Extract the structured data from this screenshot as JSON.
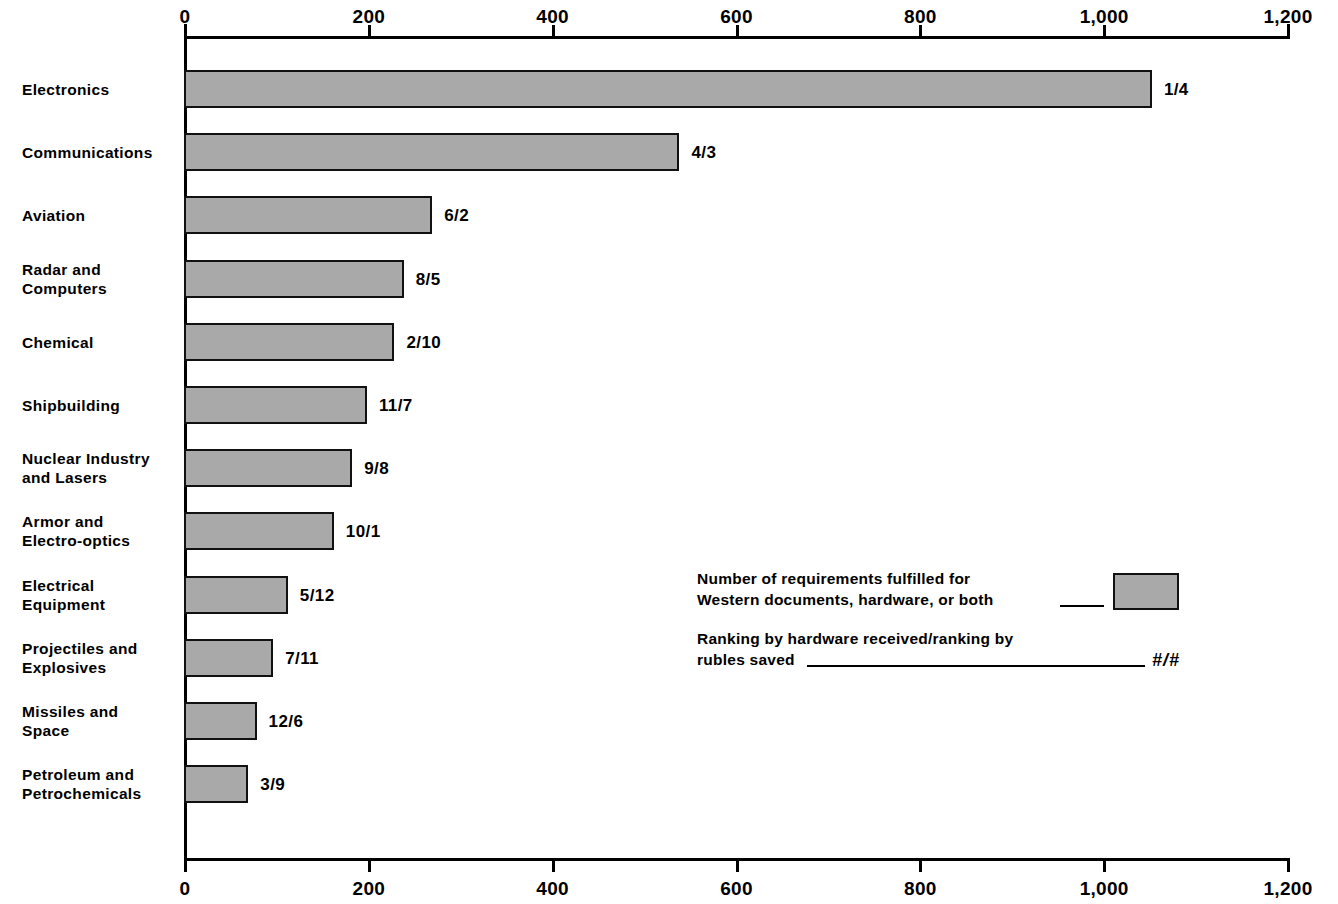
{
  "chart_data": {
    "type": "bar",
    "orientation": "horizontal",
    "title": "",
    "subtitle": "",
    "xlabel": "",
    "ylabel": "",
    "xlim": [
      0,
      1200
    ],
    "grid": false,
    "legend_position": "inside-right",
    "axis_ticks_top": [
      "0",
      "200",
      "400",
      "600",
      "800",
      "1,000",
      "1,200"
    ],
    "axis_ticks_bottom": [
      "0",
      "200",
      "400",
      "600",
      "800",
      "1,000",
      "1,200"
    ],
    "tick_values": [
      0,
      200,
      400,
      600,
      800,
      1000,
      1200
    ],
    "categories": [
      "Electronics",
      "Communications",
      "Aviation",
      "Radar and\nComputers",
      "Chemical",
      "Shipbuilding",
      "Nuclear Industry\nand Lasers",
      "Armor and\nElectro-optics",
      "Electrical\nEquipment",
      "Projectiles and\nExplosives",
      "Missiles and\nSpace",
      "Petroleum and\nPetrochemicals"
    ],
    "values": [
      1053,
      539,
      270,
      239,
      229,
      199,
      183,
      163,
      113,
      97,
      79,
      70
    ],
    "point_labels": [
      "1/4",
      "4/3",
      "6/2",
      "8/5",
      "2/10",
      "11/7",
      "9/8",
      "10/1",
      "5/12",
      "7/11",
      "12/6",
      "3/9"
    ],
    "bar_color": "#a9a9a9",
    "bar_edge_color": "#111111"
  },
  "rows": [
    {
      "label": "Electronics",
      "value": 1053,
      "point_label": "1/4"
    },
    {
      "label": "Communications",
      "value": 539,
      "point_label": "4/3"
    },
    {
      "label": "Aviation",
      "value": 270,
      "point_label": "6/2"
    },
    {
      "label": "Radar and\nComputers",
      "value": 239,
      "point_label": "8/5"
    },
    {
      "label": "Chemical",
      "value": 229,
      "point_label": "2/10"
    },
    {
      "label": "Shipbuilding",
      "value": 199,
      "point_label": "11/7"
    },
    {
      "label": "Nuclear Industry\nand Lasers",
      "value": 183,
      "point_label": "9/8"
    },
    {
      "label": "Armor and\nElectro-optics",
      "value": 163,
      "point_label": "10/1"
    },
    {
      "label": "Electrical\nEquipment",
      "value": 113,
      "point_label": "5/12"
    },
    {
      "label": "Projectiles and\nExplosives",
      "value": 97,
      "point_label": "7/11"
    },
    {
      "label": "Missiles and\nSpace",
      "value": 79,
      "point_label": "12/6"
    },
    {
      "label": "Petroleum and\nPetrochemicals",
      "value": 70,
      "point_label": "3/9"
    }
  ],
  "axis": {
    "ticks": [
      {
        "value": 0,
        "label": "0"
      },
      {
        "value": 200,
        "label": "200"
      },
      {
        "value": 400,
        "label": "400"
      },
      {
        "value": 600,
        "label": "600"
      },
      {
        "value": 800,
        "label": "800"
      },
      {
        "value": 1000,
        "label": "1,000"
      },
      {
        "value": 1200,
        "label": "1,200"
      }
    ]
  },
  "legend": {
    "entry1_text": "Number of requirements fulfilled for\nWestern documents, hardware, or both",
    "entry2_text": "Ranking by hardware received/ranking by\nrubles saved",
    "entry2_symbol": "#/#"
  }
}
